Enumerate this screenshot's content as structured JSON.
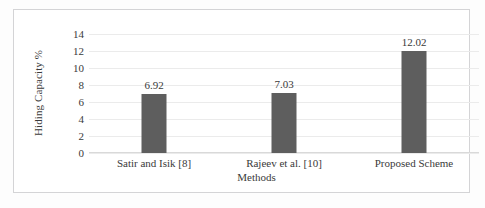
{
  "chart_data": {
    "type": "bar",
    "title": "",
    "categories": [
      "Satir and Isik [8]",
      "Rajeev et al. [10]",
      "Proposed Scheme"
    ],
    "values": [
      6.92,
      7.03,
      12.02
    ],
    "data_labels": [
      "6.92",
      "7.03",
      "12.02"
    ],
    "xlabel": "Methods",
    "ylabel": "Hiding Capacity %",
    "ylim": [
      0,
      14
    ],
    "ytick_labels": [
      "0",
      "2",
      "4",
      "6",
      "8",
      "10",
      "12",
      "14"
    ],
    "ytick_values": [
      0,
      2,
      4,
      6,
      8,
      10,
      12,
      14
    ],
    "grid": "horizontal",
    "legend": "none",
    "bar_color": "#5e5e5e",
    "gridline_color": "#ebebeb",
    "axis_color": "#d9d9d9",
    "text_color": "#3a3a3a",
    "background_color": "#ffffff",
    "frame_color": "#d4d4d6"
  }
}
